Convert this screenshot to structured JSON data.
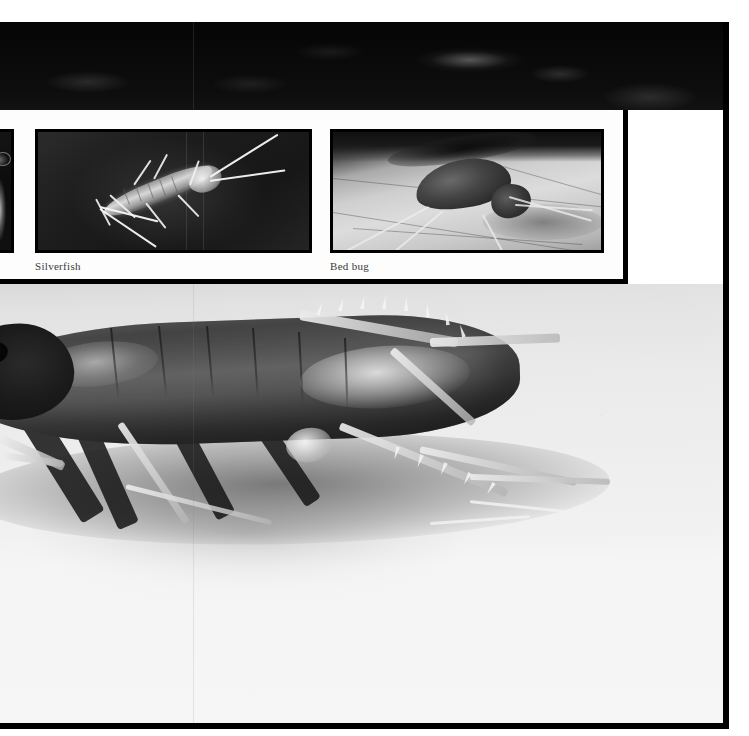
{
  "page": {
    "kind": "scanned-book-photo-plate",
    "width": 749,
    "height": 736,
    "background_color": "#ffffff",
    "border_color": "#000000"
  },
  "top_band": {
    "name": "upper-photograph-dark-band",
    "description": "Dark, heavily shadowed photograph strip running across the top of the plate",
    "background_color": "#0a0a0a"
  },
  "inset_panel": {
    "name": "inset-photo-panel",
    "background_color": "#fdfdfd",
    "border_color": "#000000",
    "photos": [
      {
        "id": "partial",
        "caption": "",
        "alt": "Partially cropped photograph of a pale insect on a dark background",
        "background_color": "#101010",
        "cropped": true
      },
      {
        "id": "silverfish",
        "caption": "Silverfish",
        "alt": "Silverfish on a dark textured surface",
        "background_color": "#1e1e1e",
        "cropped": false
      },
      {
        "id": "bedbug",
        "caption": "Bed bug",
        "alt": "Bed bug feeding on human skin",
        "background_color": "#cfcfcf",
        "cropped": false
      }
    ]
  },
  "main_photo": {
    "name": "cockroach-photograph",
    "alt": "Large cockroach in profile on a pale, grainy surface",
    "background_color": "#efefef",
    "subject_color": "#4a4a4a",
    "caption": ""
  },
  "colors": {
    "ink": "#000000",
    "paper": "#ffffff",
    "caption_text": "#3a3a3a",
    "dark_photo": "#0a0a0a",
    "light_photo": "#efefef"
  }
}
